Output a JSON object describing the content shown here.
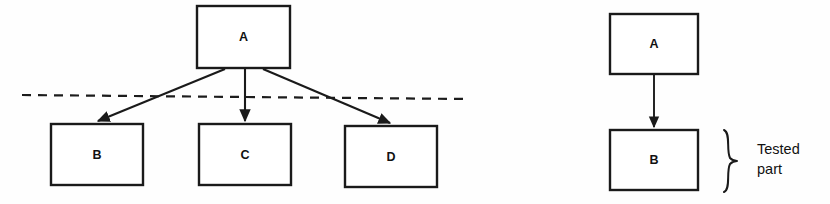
{
  "figure": {
    "background_color": "#fefefe",
    "line_color": "#1a1a1a",
    "text_color": "#111111"
  },
  "left_diagram": {
    "name": "top-down-integration-diagram",
    "nodes": [
      {
        "id": "A",
        "label": "A",
        "x": 197,
        "y": 6,
        "w": 93,
        "h": 62
      },
      {
        "id": "B",
        "label": "B",
        "x": 51,
        "y": 124,
        "w": 92,
        "h": 61
      },
      {
        "id": "C",
        "label": "C",
        "x": 199,
        "y": 124,
        "w": 92,
        "h": 61
      },
      {
        "id": "D",
        "label": "D",
        "x": 345,
        "y": 126,
        "w": 92,
        "h": 61
      }
    ],
    "edges": [
      {
        "from": "A",
        "to": "B",
        "x1": 225,
        "y1": 69,
        "x2": 98,
        "y2": 122
      },
      {
        "from": "A",
        "to": "C",
        "x1": 245,
        "y1": 69,
        "x2": 245,
        "y2": 122
      },
      {
        "from": "A",
        "to": "D",
        "x1": 263,
        "y1": 69,
        "x2": 390,
        "y2": 124
      }
    ],
    "cut_line": {
      "label": "",
      "x1": 22,
      "y1": 95,
      "x2": 466,
      "y2": 99,
      "style": "dashed"
    }
  },
  "right_diagram": {
    "name": "unit-under-test-diagram",
    "nodes": [
      {
        "id": "A",
        "label": "A",
        "x": 610,
        "y": 14,
        "w": 88,
        "h": 60
      },
      {
        "id": "B",
        "label": "B",
        "x": 610,
        "y": 130,
        "w": 88,
        "h": 60
      }
    ],
    "edges": [
      {
        "from": "A",
        "to": "B",
        "x1": 654,
        "y1": 74,
        "x2": 654,
        "y2": 128
      }
    ],
    "brace": {
      "x": 722,
      "y_top": 130,
      "y_bottom": 192,
      "tip_x": 737
    },
    "annotation": {
      "line1": "Tested",
      "line2": "part",
      "x": 757,
      "y1": 142,
      "y2": 162
    }
  }
}
